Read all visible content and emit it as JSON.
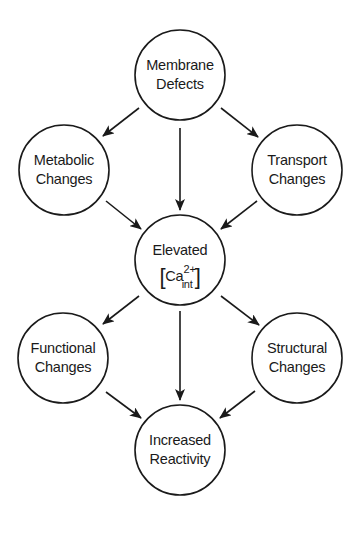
{
  "diagram": {
    "type": "flow",
    "colors": {
      "stroke": "#1a1a1a",
      "background": "#ffffff"
    },
    "nodes": [
      {
        "id": "membrane",
        "line1": "Membrane",
        "line2": "Defects",
        "cx": 180,
        "cy": 75,
        "r": 45
      },
      {
        "id": "metabolic",
        "line1": "Metabolic",
        "line2": "Changes",
        "cx": 64,
        "cy": 170,
        "r": 45
      },
      {
        "id": "transport",
        "line1": "Transport",
        "line2": "Changes",
        "cx": 297,
        "cy": 170,
        "r": 45
      },
      {
        "id": "elevated",
        "line1": "Elevated",
        "line2": "Ca",
        "sup": "2+",
        "sub": "int",
        "cx": 180,
        "cy": 260,
        "r": 45
      },
      {
        "id": "functional",
        "line1": "Functional",
        "line2": "Changes",
        "cx": 63,
        "cy": 358,
        "r": 45
      },
      {
        "id": "structural",
        "line1": "Structural",
        "line2": "Changes",
        "cx": 297,
        "cy": 358,
        "r": 45
      },
      {
        "id": "reactivity",
        "line1": "Increased",
        "line2": "Reactivity",
        "cx": 180,
        "cy": 450,
        "r": 45
      }
    ],
    "edges": [
      {
        "from": "membrane",
        "to": "metabolic"
      },
      {
        "from": "membrane",
        "to": "elevated"
      },
      {
        "from": "membrane",
        "to": "transport"
      },
      {
        "from": "metabolic",
        "to": "elevated"
      },
      {
        "from": "transport",
        "to": "elevated"
      },
      {
        "from": "elevated",
        "to": "functional"
      },
      {
        "from": "elevated",
        "to": "reactivity"
      },
      {
        "from": "elevated",
        "to": "structural"
      },
      {
        "from": "functional",
        "to": "reactivity"
      },
      {
        "from": "structural",
        "to": "reactivity"
      }
    ]
  }
}
